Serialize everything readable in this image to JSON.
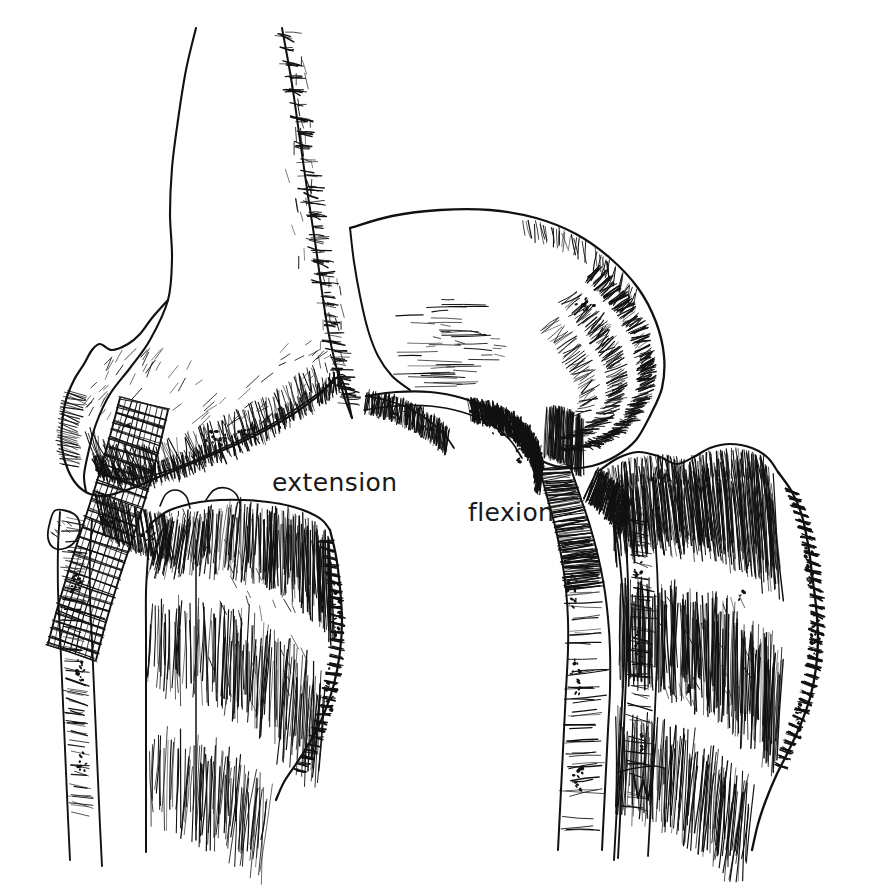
{
  "figure": {
    "medium": "pen-and-ink line drawing",
    "background_color": "#ffffff",
    "ink_color": "#111111",
    "width": 877,
    "height": 889
  },
  "labels": [
    {
      "id": "extension",
      "text": "extension",
      "x": 272,
      "y": 470,
      "font_size": 25,
      "color": "#191919"
    },
    {
      "id": "flexion",
      "text": "flexion",
      "x": 468,
      "y": 500,
      "font_size": 25,
      "color": "#191919"
    }
  ],
  "panels": [
    {
      "id": "extension-panel",
      "label": "extension",
      "description": "Left knee shown in full extension with the femur vertical above the tibia",
      "parts": [
        "femur-shaft",
        "femoral-condyle",
        "collateral-ligament",
        "patellar-tendon",
        "tibial-plateau",
        "tibia-shaft",
        "fibula"
      ]
    },
    {
      "id": "flexion-panel",
      "label": "flexion",
      "description": "Right knee shown in flexion with the femur angled forward over the tibial plateau",
      "parts": [
        "femur-shaft",
        "femoral-condyle",
        "intercondylar-notch",
        "nutrient-foramen",
        "tibial-plateau",
        "tibia-shaft",
        "fibula",
        "artist-signature"
      ]
    }
  ],
  "signature": {
    "present": true,
    "x": 640,
    "y": 790,
    "description": "small monogram mark at the lower edge of the right tibia"
  }
}
